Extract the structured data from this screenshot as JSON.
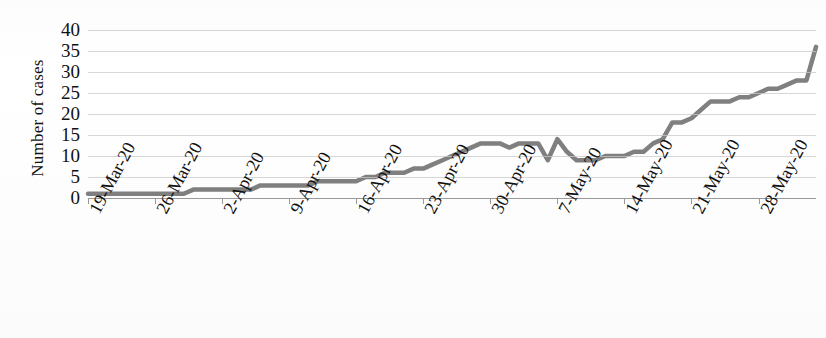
{
  "chart_data": {
    "type": "line",
    "title": "",
    "xlabel": "",
    "ylabel": "Number of cases",
    "ylim": [
      0,
      40
    ],
    "y_ticks": [
      40,
      35,
      30,
      25,
      20,
      15,
      10,
      5,
      0
    ],
    "grid": true,
    "legend": "none",
    "line_color": "#808080",
    "x_tick_labels": [
      "19-Mar-20",
      "26-Mar-20",
      "2-Apr-20",
      "9-Apr-20",
      "16-Apr-20",
      "23-Apr-20",
      "30-Apr-20",
      "7-May-20",
      "14-May-20",
      "21-May-20",
      "28-May-20"
    ],
    "x_start": "19-Mar-20",
    "x_end": "2-Jun-20",
    "x_tick_interval_days": 7,
    "series": [
      {
        "name": "Number of cases",
        "x_day_index": [
          0,
          1,
          2,
          3,
          4,
          5,
          6,
          7,
          8,
          9,
          10,
          11,
          12,
          13,
          14,
          15,
          16,
          17,
          18,
          19,
          20,
          21,
          22,
          23,
          24,
          25,
          26,
          27,
          28,
          29,
          30,
          31,
          32,
          33,
          34,
          35,
          36,
          37,
          38,
          39,
          40,
          41,
          42,
          43,
          44,
          45,
          46,
          47,
          48,
          49,
          50,
          51,
          52,
          53,
          54,
          55,
          56,
          57,
          58,
          59,
          60,
          61,
          62,
          63,
          64,
          65,
          66,
          67,
          68,
          69,
          70,
          71,
          72,
          73,
          74,
          75,
          76
        ],
        "values": [
          1,
          1,
          1,
          1,
          1,
          1,
          1,
          1,
          1,
          1,
          1,
          2,
          2,
          2,
          2,
          2,
          2,
          2,
          3,
          3,
          3,
          3,
          3,
          3,
          4,
          4,
          4,
          4,
          4,
          5,
          5,
          6,
          6,
          6,
          7,
          7,
          8,
          9,
          10,
          11,
          12,
          13,
          13,
          13,
          12,
          13,
          13,
          13,
          9,
          14,
          11,
          9,
          9,
          9,
          10,
          10,
          10,
          11,
          11,
          13,
          14,
          18,
          18,
          19,
          21,
          23,
          23,
          23,
          24,
          24,
          25,
          26,
          26,
          27,
          28,
          28,
          36
        ]
      }
    ]
  }
}
